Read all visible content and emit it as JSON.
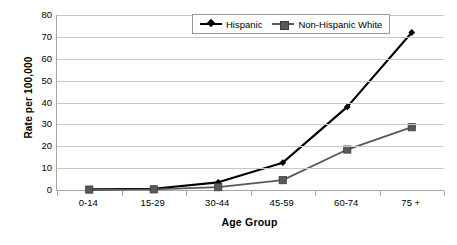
{
  "chart_data": {
    "type": "line",
    "title": "",
    "xlabel": "Age Group",
    "ylabel": "Rate per 100,000",
    "categories": [
      "0-14",
      "15-29",
      "30-44",
      "45-59",
      "60-74",
      "75 +"
    ],
    "series": [
      {
        "name": "Hispanic",
        "marker": "diamond",
        "color": "#000000",
        "values": [
          0.3,
          0.6,
          3.5,
          12.5,
          38.0,
          72.0
        ]
      },
      {
        "name": "Non-Hispanic White",
        "marker": "square",
        "color": "#595959",
        "values": [
          0.2,
          0.3,
          1.3,
          4.5,
          18.5,
          28.7
        ]
      }
    ],
    "ylim": [
      0,
      80
    ],
    "ytick_step": 10,
    "yticks": [
      "80",
      "70",
      "60",
      "50",
      "40",
      "30",
      "20",
      "10",
      "0"
    ],
    "grid": true,
    "grid_axis": "y",
    "legend_position": "top-center",
    "legend_entries": [
      "Hispanic",
      "Non-Hispanic White"
    ]
  },
  "colors": {
    "background": "#ffffff",
    "gridline": "#c8c8c8",
    "axis": "#a6a6a6",
    "series_hispanic": "#000000",
    "series_non_hispanic_white": "#595959",
    "text": "#000000"
  }
}
